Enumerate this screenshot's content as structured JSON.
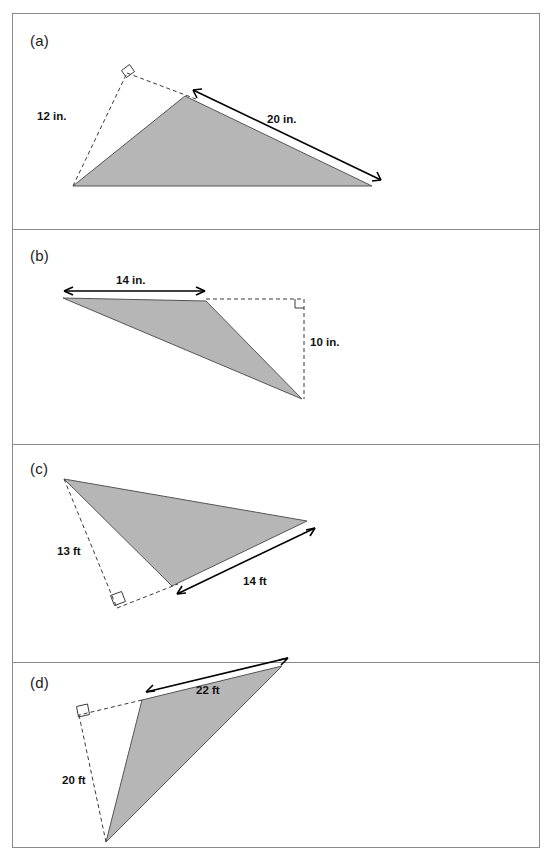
{
  "header": {
    "title": "Area of the triangle",
    "equals": "="
  },
  "panels": [
    {
      "label": "(a)",
      "dimensions": [
        {
          "text": "12 in.",
          "kind": "height"
        },
        {
          "text": "20 in.",
          "kind": "base"
        }
      ]
    },
    {
      "label": "(b)",
      "dimensions": [
        {
          "text": "14 in.",
          "kind": "base"
        },
        {
          "text": "10 in.",
          "kind": "height"
        }
      ]
    },
    {
      "label": "(c)",
      "dimensions": [
        {
          "text": "13 ft",
          "kind": "height"
        },
        {
          "text": "14 ft",
          "kind": "base"
        }
      ]
    },
    {
      "label": "(d)",
      "dimensions": [
        {
          "text": "22 ft",
          "kind": "base"
        },
        {
          "text": "20 ft",
          "kind": "height"
        }
      ]
    }
  ],
  "colors": {
    "triangle_fill": "#b6b6b6",
    "triangle_stroke": "#555555",
    "border": "#8a8a8a",
    "dimension_line": "#000000",
    "dashed_line": "#3a3a3a"
  }
}
